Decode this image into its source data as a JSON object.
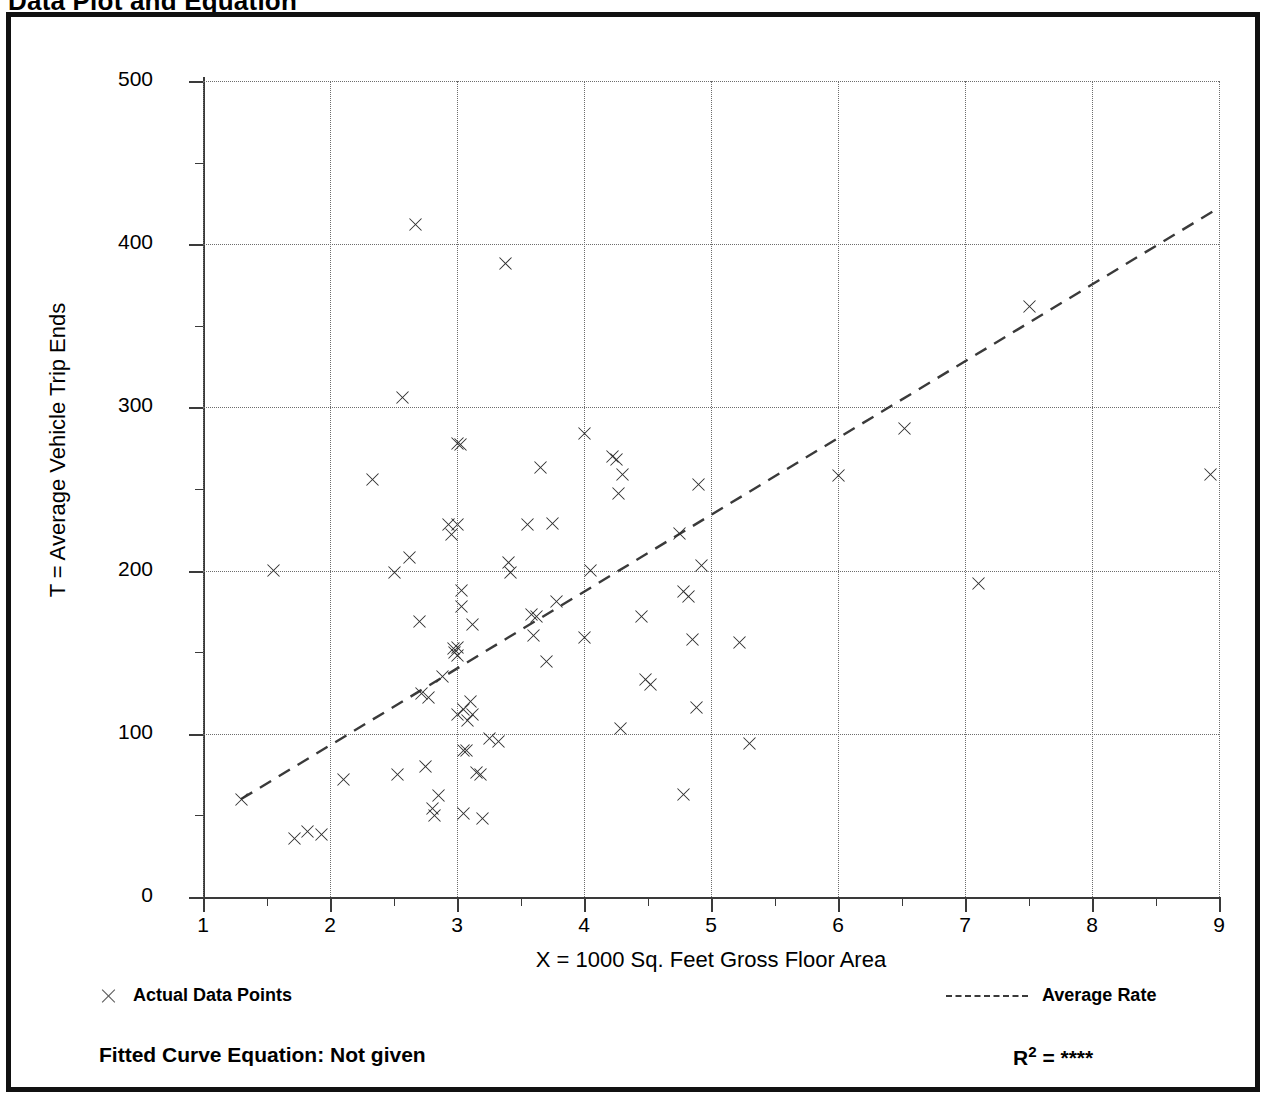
{
  "page_title": "Data Plot and Equation",
  "chart_data": {
    "type": "scatter",
    "title": "Data Plot and Equation",
    "xlabel": "X = 1000 Sq. Feet Gross Floor Area",
    "ylabel": "T = Average Vehicle Trip Ends",
    "xlim": [
      1,
      9
    ],
    "ylim": [
      0,
      500
    ],
    "xticks": [
      1,
      2,
      3,
      4,
      5,
      6,
      7,
      8,
      9
    ],
    "xtick_labels": [
      "1",
      "2",
      "3",
      "4",
      "5",
      "6",
      "7",
      "8",
      "9"
    ],
    "xticks_minor": [
      1.5,
      2.5,
      3.5,
      4.5,
      5.5,
      6.5,
      7.5,
      8.5
    ],
    "yticks": [
      0,
      100,
      200,
      300,
      400,
      500
    ],
    "ytick_labels": [
      "0",
      "100",
      "200",
      "300",
      "400",
      "500"
    ],
    "yticks_minor": [
      50,
      150,
      250,
      350,
      450
    ],
    "grid": "dotted, both axes at major ticks",
    "legend_position": "below plot",
    "series": [
      {
        "name": "Actual Data Points",
        "marker": "x",
        "color": "#2e2e2e",
        "points": [
          [
            1.3,
            60
          ],
          [
            1.55,
            200
          ],
          [
            1.72,
            36
          ],
          [
            1.82,
            40
          ],
          [
            1.93,
            38
          ],
          [
            2.1,
            72
          ],
          [
            2.33,
            256
          ],
          [
            2.5,
            199
          ],
          [
            2.53,
            75
          ],
          [
            2.57,
            306
          ],
          [
            2.62,
            208
          ],
          [
            2.67,
            412
          ],
          [
            2.7,
            169
          ],
          [
            2.72,
            125
          ],
          [
            2.75,
            80
          ],
          [
            2.77,
            122
          ],
          [
            2.8,
            54
          ],
          [
            2.82,
            50
          ],
          [
            2.85,
            62
          ],
          [
            2.88,
            135
          ],
          [
            2.93,
            228
          ],
          [
            2.95,
            222
          ],
          [
            2.97,
            152
          ],
          [
            2.98,
            150
          ],
          [
            3.0,
            278
          ],
          [
            3.0,
            228
          ],
          [
            3.0,
            153
          ],
          [
            3.0,
            148
          ],
          [
            3.0,
            112
          ],
          [
            3.02,
            277
          ],
          [
            3.03,
            188
          ],
          [
            3.03,
            178
          ],
          [
            3.05,
            115
          ],
          [
            3.05,
            90
          ],
          [
            3.05,
            51
          ],
          [
            3.07,
            90
          ],
          [
            3.08,
            108
          ],
          [
            3.1,
            120
          ],
          [
            3.12,
            167
          ],
          [
            3.12,
            112
          ],
          [
            3.15,
            76
          ],
          [
            3.18,
            75
          ],
          [
            3.2,
            48
          ],
          [
            3.25,
            97
          ],
          [
            3.32,
            95
          ],
          [
            3.38,
            388
          ],
          [
            3.4,
            205
          ],
          [
            3.42,
            199
          ],
          [
            3.55,
            228
          ],
          [
            3.58,
            173
          ],
          [
            3.6,
            160
          ],
          [
            3.62,
            172
          ],
          [
            3.65,
            263
          ],
          [
            3.7,
            144
          ],
          [
            3.75,
            229
          ],
          [
            3.78,
            181
          ],
          [
            4.0,
            284
          ],
          [
            4.0,
            159
          ],
          [
            4.05,
            200
          ],
          [
            4.22,
            270
          ],
          [
            4.25,
            268
          ],
          [
            4.27,
            247
          ],
          [
            4.3,
            259
          ],
          [
            4.45,
            172
          ],
          [
            4.48,
            133
          ],
          [
            4.52,
            130
          ],
          [
            4.75,
            223
          ],
          [
            4.78,
            187
          ],
          [
            4.82,
            184
          ],
          [
            4.85,
            158
          ],
          [
            4.88,
            116
          ],
          [
            4.9,
            253
          ],
          [
            4.92,
            203
          ],
          [
            4.78,
            63
          ],
          [
            4.28,
            103
          ],
          [
            5.22,
            156
          ],
          [
            5.3,
            94
          ],
          [
            6.0,
            258
          ],
          [
            6.52,
            287
          ],
          [
            7.1,
            192
          ],
          [
            7.5,
            362
          ],
          [
            8.93,
            259
          ]
        ]
      }
    ],
    "trend": {
      "name": "Average Rate",
      "style": "dashed",
      "color": "#3a3a3a",
      "x0": 1.3,
      "y0": 60,
      "x1": 8.95,
      "y1": 420
    }
  },
  "legend": {
    "data_points_label": "Actual Data Points",
    "average_rate_label": "Average Rate",
    "data_points_marker": "x-marker-icon",
    "average_rate_marker": "dashed-line-icon"
  },
  "footer": {
    "fitted_curve_label": "Fitted Curve Equation:  Not given",
    "r_squared_prefix": "R",
    "r_squared_exponent": "2",
    "r_squared_eq": " = ",
    "r_squared_value": "****"
  }
}
